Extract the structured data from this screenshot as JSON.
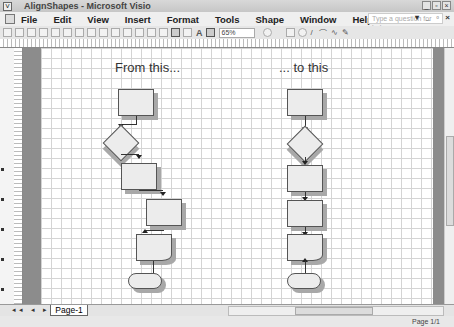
{
  "window": {
    "title": "AlignShapes - Microsoft Visio"
  },
  "menu": {
    "items": [
      "File",
      "Edit",
      "View",
      "Insert",
      "Format",
      "Tools",
      "Shape",
      "Window",
      "Help"
    ],
    "help_placeholder": "Type a question for help"
  },
  "toolbar": {
    "zoom": "65%"
  },
  "canvas": {
    "caption_left": "From this...",
    "caption_right": "... to this"
  },
  "tabs": {
    "page": "Page-1"
  },
  "status": {
    "page": "Page 1/1"
  }
}
